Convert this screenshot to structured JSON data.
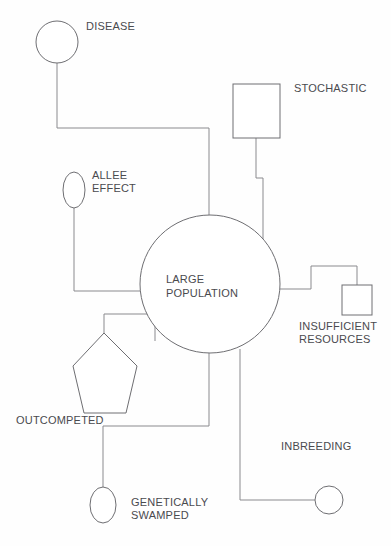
{
  "diagram": {
    "stroke_color": "#6e6e72",
    "connector_color": "#8a8a8e",
    "background_color": "#fefefe",
    "text_color": "#4a4a4e",
    "center": {
      "label_line1": "LARGE",
      "label_line2": "POPULATION",
      "shape": "ellipse"
    },
    "nodes": [
      {
        "id": "disease",
        "label": "DISEASE",
        "shape": "circle",
        "label_lines": [
          "DISEASE"
        ]
      },
      {
        "id": "stochastic",
        "label": "STOCHASTIC",
        "shape": "square",
        "label_lines": [
          "STOCHASTIC"
        ]
      },
      {
        "id": "allee-effect",
        "label": "ALLEE EFFECT",
        "shape": "ellipse",
        "label_lines": [
          "ALLEE",
          "EFFECT"
        ]
      },
      {
        "id": "insufficient-resources",
        "label": "INSUFFICIENT RESOURCES",
        "shape": "square",
        "label_lines": [
          "INSUFFICIENT",
          "RESOURCES"
        ]
      },
      {
        "id": "outcompeted",
        "label": "OUTCOMPETED",
        "shape": "pentagon",
        "label_lines": [
          "OUTCOMPETED"
        ]
      },
      {
        "id": "genetically-swamped",
        "label": "GENETICALLY SWAMPED",
        "shape": "ellipse",
        "label_lines": [
          "GENETICALLY",
          "SWAMPED"
        ]
      },
      {
        "id": "inbreeding",
        "label": "INBREEDING",
        "shape": "circle",
        "label_lines": [
          "INBREEDING"
        ]
      }
    ],
    "labels": {
      "disease": "DISEASE",
      "stochastic": "STOCHASTIC",
      "allee_line1": "ALLEE",
      "allee_line2": "EFFECT",
      "center_line1": "LARGE",
      "center_line2": "POPULATION",
      "insufficient_line1": "INSUFFICIENT",
      "insufficient_line2": "RESOURCES",
      "outcompeted": "OUTCOMPETED",
      "genetically_line1": "GENETICALLY",
      "genetically_line2": "SWAMPED",
      "inbreeding": "INBREEDING"
    }
  }
}
